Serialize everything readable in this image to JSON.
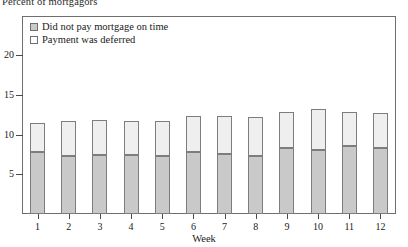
{
  "chart_data": {
    "type": "bar",
    "stacked": true,
    "title": "Percent of mortgagors",
    "xlabel": "Week",
    "ylabel": "",
    "categories": [
      "1",
      "2",
      "3",
      "4",
      "5",
      "6",
      "7",
      "8",
      "9",
      "10",
      "11",
      "12"
    ],
    "series": [
      {
        "name": "Did not pay mortgage on time",
        "color": "#c9c9c9",
        "values": [
          7.8,
          7.3,
          7.5,
          7.4,
          7.3,
          7.8,
          7.6,
          7.3,
          8.3,
          8.1,
          8.6,
          8.3
        ]
      },
      {
        "name": "Payment was deferred",
        "color": "#efefef",
        "values": [
          3.7,
          4.4,
          4.3,
          4.3,
          4.4,
          4.5,
          4.8,
          4.9,
          4.6,
          5.1,
          4.3,
          4.4
        ]
      }
    ],
    "totals": [
      11.5,
      11.7,
      11.8,
      11.7,
      11.7,
      12.3,
      12.4,
      12.2,
      12.9,
      13.2,
      12.9,
      12.7
    ],
    "yticks": [
      5,
      10,
      15,
      20
    ],
    "ylim": [
      0,
      23.5
    ],
    "grid": false,
    "legend_position": "top-left"
  },
  "legend": {
    "items": [
      {
        "label": "Did not pay mortgage on time",
        "swatch": "gray-swatch"
      },
      {
        "label": "Payment was deferred",
        "swatch": "white-swatch"
      }
    ]
  },
  "axes": {
    "y_title": "Percent of mortgagors",
    "x_title": "Week",
    "y_tick_labels": [
      "5",
      "10",
      "15",
      "20"
    ],
    "x_tick_labels": [
      "1",
      "2",
      "3",
      "4",
      "5",
      "6",
      "7",
      "8",
      "9",
      "10",
      "11",
      "12"
    ]
  },
  "colors": {
    "lower_segment": "#c9c9c9",
    "upper_segment": "#efefef",
    "frame": "#6f6f6f",
    "text": "#1a1a1a"
  }
}
